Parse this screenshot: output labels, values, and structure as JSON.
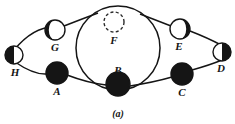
{
  "figure": {
    "caption": "(a)",
    "canvas": {
      "width": 235,
      "height": 124,
      "background": "#ffffff"
    },
    "stroke_color": "#151515",
    "fill_color": "#151515",
    "empty_color": "#ffffff",
    "central_circle": {
      "cx": 118,
      "cy": 48,
      "r": 42
    },
    "nodes": [
      {
        "id": "A",
        "label": "A",
        "cx": 57,
        "cy": 73,
        "r": 11,
        "fill": "full",
        "label_x": 57,
        "label_y": 95
      },
      {
        "id": "B",
        "label": "B",
        "cx": 118,
        "cy": 84,
        "r": 12,
        "fill": "full",
        "label_x": 118,
        "label_y": 74
      },
      {
        "id": "C",
        "label": "C",
        "cx": 182,
        "cy": 74,
        "r": 11,
        "fill": "full",
        "label_x": 182,
        "label_y": 96
      },
      {
        "id": "D",
        "label": "D",
        "cx": 222,
        "cy": 52,
        "r": 9,
        "fill": "right-half",
        "label_x": 221,
        "label_y": 72
      },
      {
        "id": "E",
        "label": "E",
        "cx": 180,
        "cy": 29,
        "r": 10,
        "fill": "right-crescent",
        "label_x": 179,
        "label_y": 50
      },
      {
        "id": "F",
        "label": "F",
        "cx": 114,
        "cy": 22,
        "r": 10,
        "fill": "dashed",
        "label_x": 114,
        "label_y": 44
      },
      {
        "id": "G",
        "label": "G",
        "cx": 55,
        "cy": 30,
        "r": 10,
        "fill": "left-crescent",
        "label_x": 55,
        "label_y": 51
      },
      {
        "id": "H",
        "label": "H",
        "cx": 14,
        "cy": 55,
        "r": 9,
        "fill": "left-half",
        "label_x": 15,
        "label_y": 76
      }
    ],
    "orbits": [
      {
        "id": "upper-left-arc",
        "d": "M 14 50 Q 34 26 55 27"
      },
      {
        "id": "upper-left-link",
        "d": "M 64 26 Q 82 19 98 13"
      },
      {
        "id": "lower-left-arc",
        "d": "M 15 62 Q 34 75 47 74"
      },
      {
        "id": "lower-left-link",
        "d": "M 67 75 Q 88 83 106 85"
      },
      {
        "id": "upper-right-link",
        "d": "M 140 14 Q 158 21 171 26"
      },
      {
        "id": "upper-right-arc",
        "d": "M 190 31 Q 208 38 221 45"
      },
      {
        "id": "lower-right-link",
        "d": "M 130 86 Q 155 82 172 77"
      },
      {
        "id": "lower-right-arc",
        "d": "M 192 70 Q 210 65 222 60"
      }
    ]
  }
}
